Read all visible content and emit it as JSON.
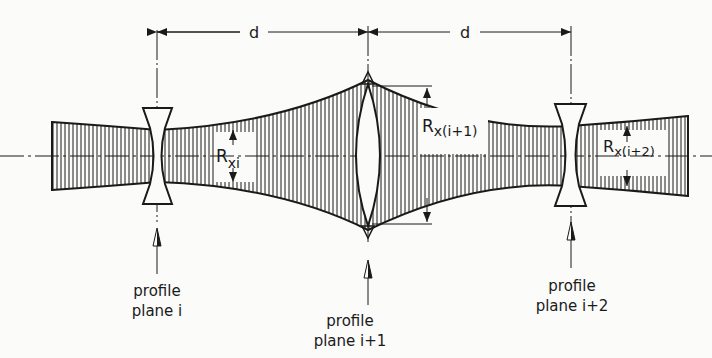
{
  "diagram": {
    "dimension_label_1": "d",
    "dimension_label_2": "d",
    "radius_labels": {
      "r1_main": "R",
      "r1_sub": "xi",
      "r2_main": "R",
      "r2_sub": "x(i+1)",
      "r3_main": "R",
      "r3_sub": "x(i+2)"
    },
    "planes": [
      {
        "line1": "profile",
        "line2": "plane i"
      },
      {
        "line1": "profile",
        "line2": "plane i+1"
      },
      {
        "line1": "profile",
        "line2": "plane i+2"
      }
    ],
    "colors": {
      "ink": "#1a1a1a",
      "background": "#fbfbf9"
    }
  }
}
